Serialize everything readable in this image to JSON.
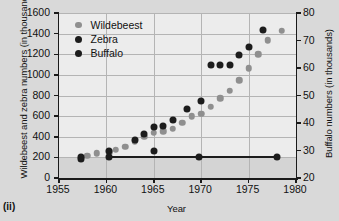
{
  "figure": {
    "caption": "(ii)",
    "xlabel": "Year",
    "ylabel_left": "Wildebeest and zebra numbers (in thousands)",
    "ylabel_right": "Buffalo numbers (in thousands)"
  },
  "legend": {
    "position": "top-left-inside",
    "items": [
      {
        "label": "Wildebeest",
        "color": "#8f8f8f",
        "marker": "circle"
      },
      {
        "label": "Zebra",
        "color": "#1c1c1c",
        "marker": "circle"
      },
      {
        "label": "Buffalo",
        "color": "#1c1c1c",
        "marker": "circle"
      }
    ]
  },
  "axes": {
    "x_ticks": [
      "1955",
      "1960",
      "1965",
      "1970",
      "1975",
      "1980"
    ],
    "y_ticks_left": [
      "0",
      "200",
      "400",
      "600",
      "800",
      "1000",
      "1200",
      "1400",
      "1600"
    ],
    "y_ticks_right": [
      "20",
      "30",
      "40",
      "50",
      "60",
      "70",
      "80"
    ]
  },
  "chart_data": {
    "type": "scatter",
    "title": "",
    "xlabel": "Year",
    "ylabel": "Wildebeest and zebra numbers (in thousands)",
    "ylabel_secondary": "Buffalo numbers (in thousands)",
    "xlim": [
      1955,
      1980
    ],
    "ylim": [
      0,
      1600
    ],
    "ylim_secondary": [
      20,
      80
    ],
    "grid": true,
    "legend_position": "upper left",
    "series": [
      {
        "name": "Wildebeest",
        "axis": "left",
        "color": "#8f8f8f",
        "marker": "circle",
        "points": [
          {
            "x": 1958.0,
            "y": 215
          },
          {
            "x": 1959.0,
            "y": 240
          },
          {
            "x": 1960.3,
            "y": 250
          },
          {
            "x": 1961.0,
            "y": 275
          },
          {
            "x": 1962.0,
            "y": 305
          },
          {
            "x": 1963.0,
            "y": 355
          },
          {
            "x": 1964.0,
            "y": 400
          },
          {
            "x": 1965.0,
            "y": 440
          },
          {
            "x": 1966.0,
            "y": 455
          },
          {
            "x": 1967.0,
            "y": 480
          },
          {
            "x": 1968.0,
            "y": 535
          },
          {
            "x": 1969.0,
            "y": 600
          },
          {
            "x": 1970.0,
            "y": 625
          },
          {
            "x": 1971.0,
            "y": 690
          },
          {
            "x": 1972.0,
            "y": 775
          },
          {
            "x": 1973.0,
            "y": 845
          },
          {
            "x": 1974.0,
            "y": 950
          },
          {
            "x": 1975.0,
            "y": 1065
          },
          {
            "x": 1976.0,
            "y": 1200
          },
          {
            "x": 1977.0,
            "y": 1335
          },
          {
            "x": 1978.5,
            "y": 1430
          }
        ]
      },
      {
        "name": "Zebra",
        "axis": "left",
        "color": "#1c1c1c",
        "marker": "circle",
        "points": [
          {
            "x": 1957.3,
            "y": 180
          },
          {
            "x": 1960.3,
            "y": 265
          },
          {
            "x": 1963.0,
            "y": 370
          },
          {
            "x": 1964.0,
            "y": 430
          },
          {
            "x": 1965.0,
            "y": 495
          },
          {
            "x": 1966.0,
            "y": 500
          },
          {
            "x": 1967.0,
            "y": 560
          },
          {
            "x": 1968.5,
            "y": 670
          },
          {
            "x": 1970.0,
            "y": 745
          },
          {
            "x": 1971.0,
            "y": 1100
          },
          {
            "x": 1972.0,
            "y": 1095
          },
          {
            "x": 1973.0,
            "y": 1095
          },
          {
            "x": 1974.0,
            "y": 1195
          },
          {
            "x": 1975.0,
            "y": 1275
          },
          {
            "x": 1976.5,
            "y": 1440
          }
        ]
      },
      {
        "name": "Buffalo",
        "axis": "right",
        "color": "#1c1c1c",
        "marker": "circle",
        "connected": true,
        "points": [
          {
            "x": 1957.3,
            "y": 27.5
          },
          {
            "x": 1960.3,
            "y": 27.5
          },
          {
            "x": 1965.0,
            "y": 30.0
          },
          {
            "x": 1969.8,
            "y": 27.5
          },
          {
            "x": 1978.0,
            "y": 27.5
          }
        ]
      }
    ]
  }
}
